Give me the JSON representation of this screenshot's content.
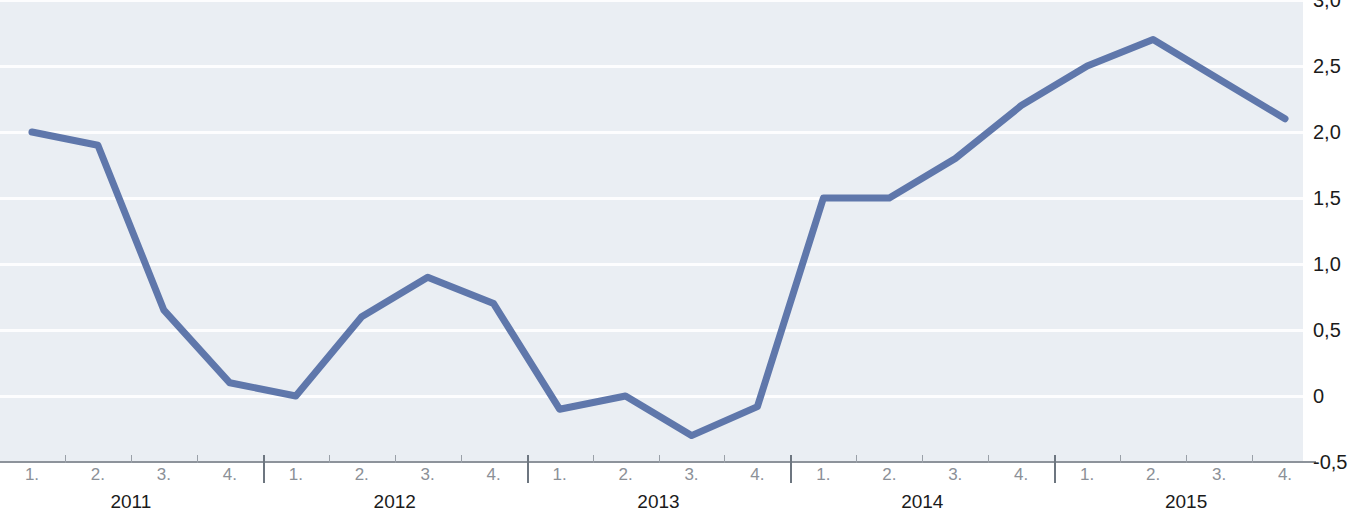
{
  "chart_data": {
    "type": "line",
    "title": "",
    "subtitle": "",
    "xlabel": "",
    "ylabel": "",
    "grid": true,
    "legend": "none",
    "ylim": [
      -0.5,
      3.0
    ],
    "ytick_labels": [
      "3,0",
      "2,5",
      "2,0",
      "1,5",
      "1,0",
      "0,5",
      "0",
      "-0,5"
    ],
    "ytick_values": [
      3.0,
      2.5,
      2.0,
      1.5,
      1.0,
      0.5,
      0.0,
      -0.5
    ],
    "categories": [
      "2011 1.",
      "2011 2.",
      "2011 3.",
      "2011 4.",
      "2012 1.",
      "2012 2.",
      "2012 3.",
      "2012 4.",
      "2013 1.",
      "2013 2.",
      "2013 3.",
      "2013 4.",
      "2014 1.",
      "2014 2.",
      "2014 3.",
      "2014 4.",
      "2015 1.",
      "2015 2.",
      "2015 3.",
      "2015 4."
    ],
    "values": [
      2.0,
      1.9,
      0.65,
      0.1,
      0.0,
      0.6,
      0.9,
      0.7,
      -0.1,
      0.0,
      -0.3,
      -0.08,
      1.5,
      1.5,
      1.8,
      2.2,
      2.5,
      2.7,
      2.4,
      2.1
    ],
    "quarter_labels": [
      "1.",
      "2.",
      "3.",
      "4."
    ],
    "year_labels": [
      "2011",
      "2012",
      "2013",
      "2014",
      "2015"
    ],
    "series": [
      {
        "name": "",
        "color": "#5f77ab",
        "values": [
          2.0,
          1.9,
          0.65,
          0.1,
          0.0,
          0.6,
          0.9,
          0.7,
          -0.1,
          0.0,
          -0.3,
          -0.08,
          1.5,
          1.5,
          1.8,
          2.2,
          2.5,
          2.7,
          2.4,
          2.1
        ]
      }
    ]
  },
  "colors": {
    "line": "#5f77ab",
    "plot_background": "#eaeef3",
    "gridline": "#fdfdfe",
    "axis": "#8d939b",
    "label_primary": "#1b1b1b",
    "label_muted": "#8b9097"
  }
}
